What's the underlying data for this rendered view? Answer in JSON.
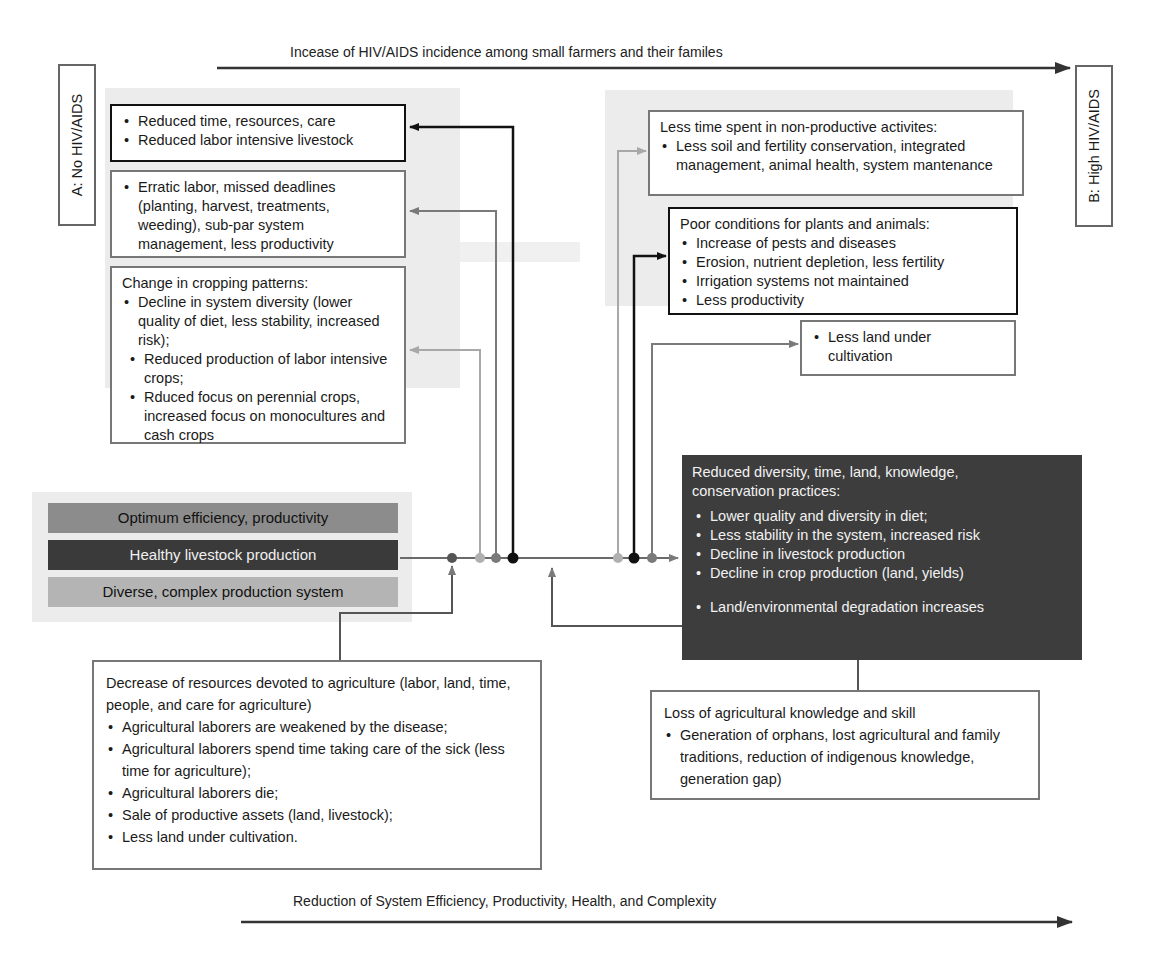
{
  "top_axis": {
    "label": "Incease of HIV/AIDS incidence among small farmers and their familes",
    "direction": "right"
  },
  "bottom_axis": {
    "label": "Reduction of System Efficiency, Productivity, Health, and Complexity",
    "direction": "right"
  },
  "state_a": {
    "label": "A: No HIV/AIDS"
  },
  "state_b": {
    "label": "B: High HIV/AIDS"
  },
  "left_column": {
    "box1": {
      "items": [
        "Reduced time, resources, care",
        "Reduced labor intensive livestock"
      ]
    },
    "box2": {
      "items": [
        "Erratic labor, missed deadlines (planting, harvest, treatments, weeding), sub-par system management, less productivity"
      ]
    },
    "box3": {
      "heading": "Change in cropping patterns:",
      "items": [
        "Decline in system diversity (lower quality of diet, less stability, increased risk);",
        "Reduced production of labor intensive crops;",
        "Rduced focus on perennial crops, increased focus on monocultures and cash crops"
      ]
    }
  },
  "right_column": {
    "box1": {
      "heading": "Less time spent in non-productive activites:",
      "items": [
        "Less soil and fertility conservation, integrated management, animal health, system mantenance"
      ]
    },
    "box2": {
      "heading": "Poor conditions for plants and animals:",
      "items": [
        "Increase of pests and diseases",
        "Erosion, nutrient depletion, less fertility",
        "Irrigation systems not maintained",
        "Less productivity"
      ]
    },
    "box3": {
      "items": [
        "Less land under cultivation"
      ]
    }
  },
  "system_bars": [
    {
      "label": "Optimum efficiency, productivity",
      "color": "#8c8c8c",
      "text_color": "#111111"
    },
    {
      "label": "Healthy livestock production",
      "color": "#3a3a3a",
      "text_color": "#f0f0f0"
    },
    {
      "label": "Diverse, complex production system",
      "color": "#b4b4b4",
      "text_color": "#111111"
    }
  ],
  "outcome_box": {
    "heading": "Reduced diversity, time, land, knowledge, conservation practices:",
    "items": [
      "Lower quality and diversity in diet;",
      "Less stability in the system, increased risk",
      "Decline in livestock production",
      "Decline in crop production (land, yields)"
    ],
    "extra_item": "Land/environmental degradation increases",
    "color": "#3d3d3d"
  },
  "resources_box": {
    "heading": "Decrease of resources devoted to agriculture (labor, land, time, people, and care for agriculture)",
    "items": [
      "Agricultural laborers are weakened by the disease;",
      "Agricultural laborers spend time taking care of the sick (less time for agriculture);",
      "Agricultural laborers die;",
      "Sale of productive assets (land, livestock);",
      "Less land under cultivation."
    ]
  },
  "knowledge_box": {
    "heading": "Loss of agricultural knowledge and skill",
    "items": [
      "Generation of orphans, lost agricultural and family traditions, reduction of indigenous knowledge, generation gap)"
    ]
  },
  "colors": {
    "line_dark": "#111111",
    "line_mid": "#7a7a7a",
    "line_light": "#a8a8a8",
    "zone_bg": "#ececec"
  }
}
